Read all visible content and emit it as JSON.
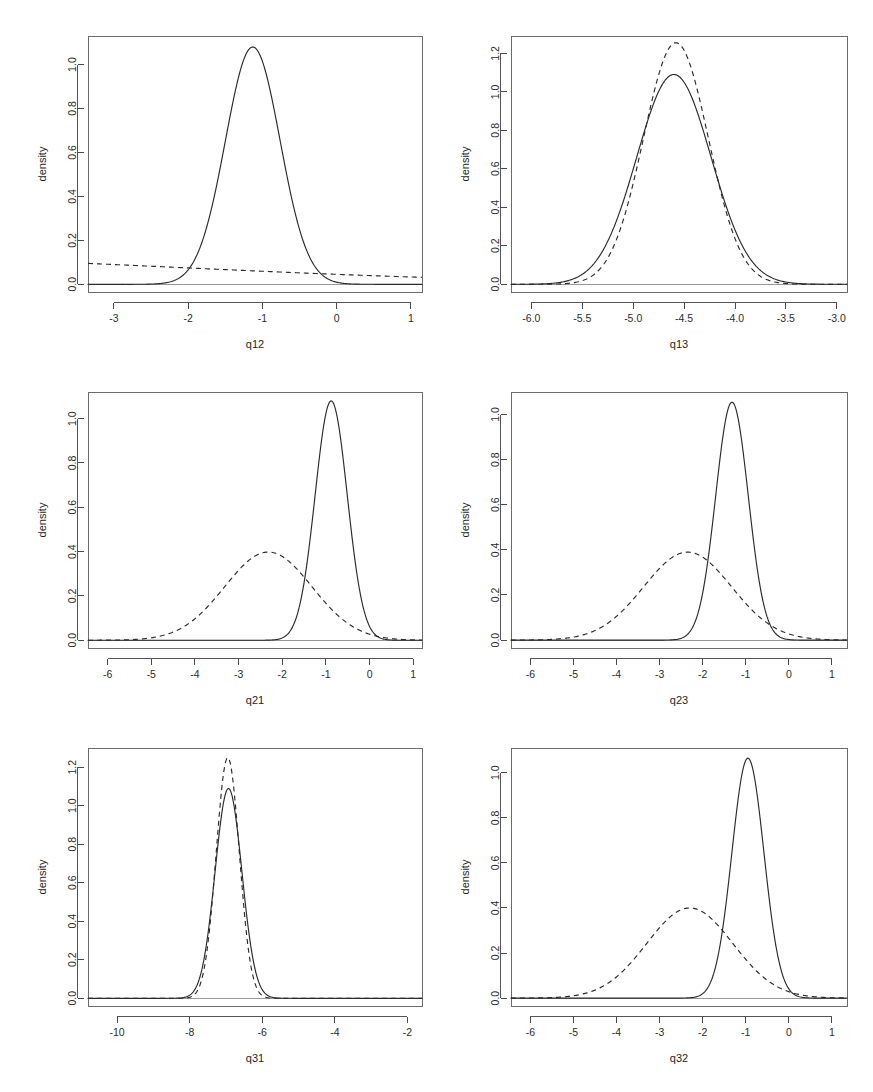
{
  "figure": {
    "type": "multi-panel-density-plot",
    "rows": 3,
    "cols": 2,
    "background": "#ffffff",
    "line_color": "#2a2a2a",
    "frame_color": "#6b6b6b",
    "ylabel_common": "density"
  },
  "chart_data": [
    {
      "type": "line",
      "panel": "q12",
      "title": "",
      "xlabel": "q12",
      "ylabel": "density",
      "xlim": [
        -3.35,
        1.15
      ],
      "ylim": [
        -0.035,
        1.13
      ],
      "xticks": [
        -3,
        -2,
        -1,
        0,
        1
      ],
      "xticklabels": [
        "-3",
        "-2",
        "-1",
        "0",
        "1"
      ],
      "yticks": [
        0.0,
        0.2,
        0.4,
        0.6,
        0.8,
        1.0
      ],
      "yticklabels": [
        "0.0",
        "0.2",
        "0.4",
        "0.6",
        "0.8",
        "1.0"
      ],
      "grid": false,
      "legend": "none",
      "series": [
        {
          "name": "posterior",
          "style": "solid",
          "shape": "gaussian",
          "mean": -1.13,
          "sd": 0.368,
          "peak": 1.08
        },
        {
          "name": "prior",
          "style": "dashed",
          "shape": "gaussian",
          "mean": -7.2,
          "sd": 5.0,
          "peak": 0.128
        }
      ]
    },
    {
      "type": "line",
      "panel": "q13",
      "title": "",
      "xlabel": "q13",
      "ylabel": "density",
      "xlim": [
        -6.2,
        -2.9
      ],
      "ylim": [
        -0.04,
        1.29
      ],
      "xticks": [
        -6.0,
        -5.5,
        -5.0,
        -4.5,
        -4.0,
        -3.5,
        -3.0
      ],
      "xticklabels": [
        "-6.0",
        "-5.5",
        "-5.0",
        "-4.5",
        "-4.0",
        "-3.5",
        "-3.0"
      ],
      "yticks": [
        0.0,
        0.2,
        0.4,
        0.6,
        0.8,
        1.0,
        1.2
      ],
      "yticklabels": [
        "0.0",
        "0.2",
        "0.4",
        "0.6",
        "0.8",
        "1.0",
        "1.2"
      ],
      "grid": false,
      "legend": "none",
      "series": [
        {
          "name": "posterior",
          "style": "solid",
          "shape": "gaussian",
          "mean": -4.6,
          "sd": 0.365,
          "peak": 1.09
        },
        {
          "name": "prior",
          "style": "dashed",
          "shape": "gaussian",
          "mean": -4.58,
          "sd": 0.318,
          "peak": 1.255
        }
      ]
    },
    {
      "type": "line",
      "panel": "q21",
      "title": "",
      "xlabel": "q21",
      "ylabel": "density",
      "xlim": [
        -6.45,
        1.2
      ],
      "ylim": [
        -0.035,
        1.12
      ],
      "xticks": [
        -6,
        -5,
        -4,
        -3,
        -2,
        -1,
        0,
        1
      ],
      "xticklabels": [
        "-6",
        "-5",
        "-4",
        "-3",
        "-2",
        "-1",
        "0",
        "1"
      ],
      "yticks": [
        0.0,
        0.2,
        0.4,
        0.6,
        0.8,
        1.0
      ],
      "yticklabels": [
        "0.0",
        "0.2",
        "0.4",
        "0.6",
        "0.8",
        "1.0"
      ],
      "grid": false,
      "legend": "none",
      "series": [
        {
          "name": "posterior",
          "style": "solid",
          "shape": "gaussian",
          "mean": -0.88,
          "sd": 0.368,
          "peak": 1.08
        },
        {
          "name": "prior",
          "style": "dashed",
          "shape": "gaussian",
          "mean": -2.32,
          "sd": 1.0,
          "peak": 0.398
        }
      ]
    },
    {
      "type": "line",
      "panel": "q23",
      "title": "",
      "xlabel": "q23",
      "ylabel": "density",
      "xlim": [
        -6.45,
        1.35
      ],
      "ylim": [
        -0.035,
        1.1
      ],
      "xticks": [
        -6,
        -5,
        -4,
        -3,
        -2,
        -1,
        0,
        1
      ],
      "xticklabels": [
        "-6",
        "-5",
        "-4",
        "-3",
        "-2",
        "-1",
        "0",
        "1"
      ],
      "yticks": [
        0.0,
        0.2,
        0.4,
        0.6,
        0.8,
        1.0
      ],
      "yticklabels": [
        "0.0",
        "0.2",
        "0.4",
        "0.6",
        "0.8",
        "1.0"
      ],
      "grid": false,
      "legend": "none",
      "series": [
        {
          "name": "posterior",
          "style": "solid",
          "shape": "gaussian",
          "mean": -1.32,
          "sd": 0.378,
          "peak": 1.055
        },
        {
          "name": "prior",
          "style": "dashed",
          "shape": "gaussian",
          "mean": -2.35,
          "sd": 1.02,
          "peak": 0.39
        }
      ]
    },
    {
      "type": "line",
      "panel": "q31",
      "title": "",
      "xlabel": "q31",
      "ylabel": "density",
      "xlim": [
        -10.8,
        -1.6
      ],
      "ylim": [
        -0.04,
        1.3
      ],
      "xticks": [
        -10,
        -8,
        -6,
        -4,
        -2
      ],
      "xticklabels": [
        "-10",
        "-8",
        "-6",
        "-4",
        "-2"
      ],
      "yticks": [
        0.0,
        0.2,
        0.4,
        0.6,
        0.8,
        1.0,
        1.2
      ],
      "yticklabels": [
        "0.0",
        "0.2",
        "0.4",
        "0.6",
        "0.8",
        "1.0",
        "1.2"
      ],
      "grid": false,
      "legend": "none",
      "series": [
        {
          "name": "posterior",
          "style": "solid",
          "shape": "gaussian",
          "mean": -6.93,
          "sd": 0.368,
          "peak": 1.09
        },
        {
          "name": "prior",
          "style": "dashed",
          "shape": "gaussian",
          "mean": -6.95,
          "sd": 0.318,
          "peak": 1.25
        }
      ]
    },
    {
      "type": "line",
      "panel": "q32",
      "title": "",
      "xlabel": "q32",
      "ylabel": "density",
      "xlim": [
        -6.45,
        1.35
      ],
      "ylim": [
        -0.035,
        1.11
      ],
      "xticks": [
        -6,
        -5,
        -4,
        -3,
        -2,
        -1,
        0,
        1
      ],
      "xticklabels": [
        "-6",
        "-5",
        "-4",
        "-3",
        "-2",
        "-1",
        "0",
        "1"
      ],
      "yticks": [
        0.0,
        0.2,
        0.4,
        0.6,
        0.8,
        1.0
      ],
      "yticklabels": [
        "0.0",
        "0.2",
        "0.4",
        "0.6",
        "0.8",
        "1.0"
      ],
      "grid": false,
      "legend": "none",
      "series": [
        {
          "name": "posterior",
          "style": "solid",
          "shape": "gaussian",
          "mean": -0.95,
          "sd": 0.372,
          "peak": 1.065
        },
        {
          "name": "prior",
          "style": "dashed",
          "shape": "gaussian",
          "mean": -2.3,
          "sd": 1.0,
          "peak": 0.4
        }
      ]
    }
  ],
  "panel_layout": [
    {
      "key": "q12",
      "x": 14,
      "y": 14,
      "w": 420,
      "h": 350
    },
    {
      "key": "q13",
      "x": 437,
      "y": 14,
      "w": 422,
      "h": 350
    },
    {
      "key": "q21",
      "x": 14,
      "y": 370,
      "w": 420,
      "h": 350
    },
    {
      "key": "q23",
      "x": 437,
      "y": 370,
      "w": 422,
      "h": 350
    },
    {
      "key": "q31",
      "x": 14,
      "y": 726,
      "w": 420,
      "h": 352
    },
    {
      "key": "q32",
      "x": 437,
      "y": 726,
      "w": 422,
      "h": 352
    }
  ]
}
